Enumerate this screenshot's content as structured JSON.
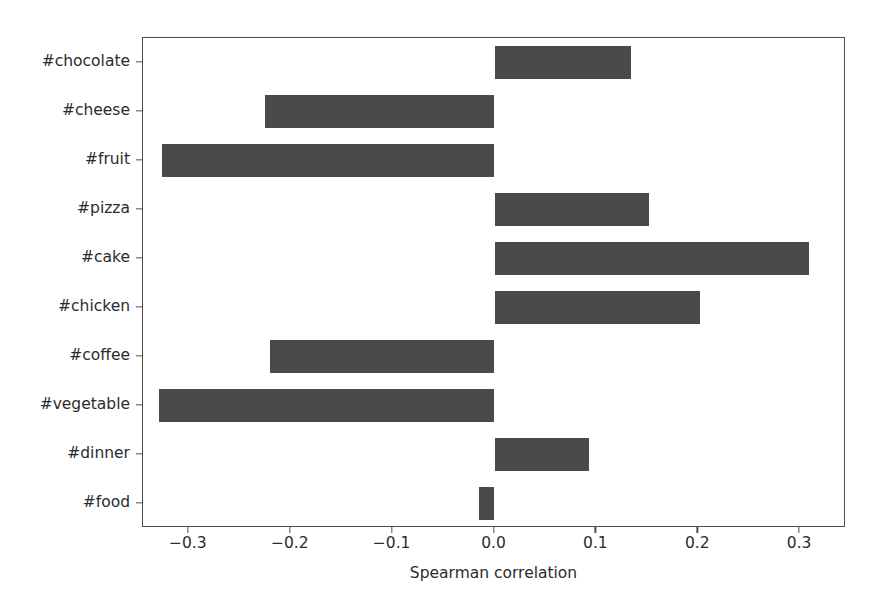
{
  "chart_data": {
    "type": "bar",
    "orientation": "horizontal",
    "title": "",
    "xlabel": "Spearman correlation",
    "ylabel": "",
    "categories": [
      "#chocolate",
      "#cheese",
      "#fruit",
      "#pizza",
      "#cake",
      "#chicken",
      "#coffee",
      "#vegetable",
      "#dinner",
      "#food"
    ],
    "values": [
      0.134,
      -0.225,
      -0.326,
      0.152,
      0.309,
      0.202,
      -0.22,
      -0.329,
      0.093,
      -0.015
    ],
    "xlim": [
      -0.345,
      0.345
    ],
    "xticks": [
      -0.3,
      -0.2,
      -0.1,
      0.0,
      0.1,
      0.2,
      0.3
    ],
    "xtick_labels": [
      "−0.3",
      "−0.2",
      "−0.1",
      "0.0",
      "0.1",
      "0.2",
      "0.3"
    ],
    "grid": false,
    "legend": null,
    "bar_color": "#4a4a4a",
    "axis_color": "#4d4d4d",
    "background_color": "#ffffff"
  }
}
